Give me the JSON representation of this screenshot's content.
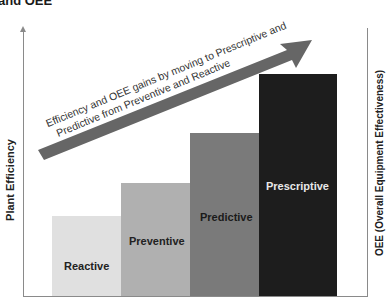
{
  "title": "and OEE",
  "axes": {
    "left_label": "Plant Efficiency",
    "right_label": "OEE (Overall Equipment Effectiveness)"
  },
  "arrow": {
    "line1": "Efficiency and OEE gains by moving to Prescriptive and",
    "line2": "Predictive from Preventive and Reactive",
    "color": "#666666"
  },
  "bars": [
    {
      "label": "Reactive",
      "color": "#e0e0e0",
      "relative_height": 80
    },
    {
      "label": "Preventive",
      "color": "#b0b0b0",
      "relative_height": 113
    },
    {
      "label": "Predictive",
      "color": "#7a7a7a",
      "relative_height": 163
    },
    {
      "label": "Prescriptive",
      "color": "#1d1d1d",
      "relative_height": 222
    }
  ]
}
